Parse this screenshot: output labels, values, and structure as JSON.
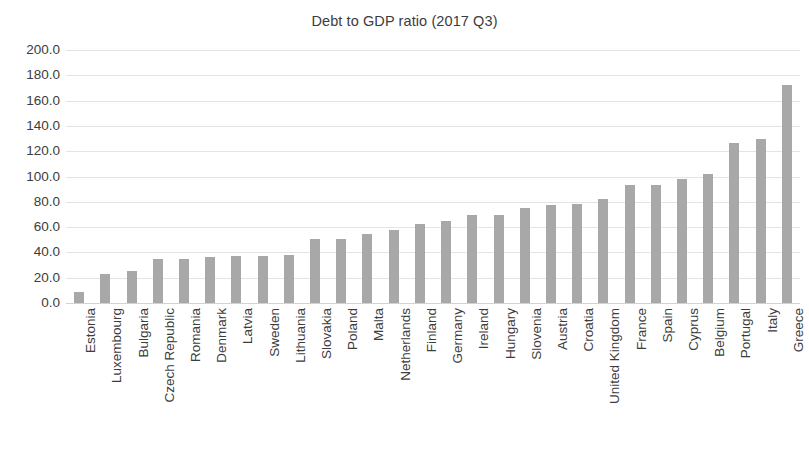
{
  "chart_data": {
    "type": "bar",
    "title": "Debt to GDP ratio (2017 Q3)",
    "xlabel": "",
    "ylabel": "",
    "ylim": [
      0,
      200
    ],
    "ytick_step": 20,
    "ytick_labels": [
      "200.0",
      "180.0",
      "160.0",
      "140.0",
      "120.0",
      "100.0",
      "80.0",
      "60.0",
      "40.0",
      "20.0",
      "0.0"
    ],
    "yticks": [
      200,
      180,
      160,
      140,
      120,
      100,
      80,
      60,
      40,
      20,
      0
    ],
    "grid": true,
    "legend": null,
    "bar_color": "#a8a8a8",
    "categories": [
      "Estonia",
      "Luxembourg",
      "Bulgaria",
      "Czech Republic",
      "Romania",
      "Denmark",
      "Latvia",
      "Sweden",
      "Lithuania",
      "Slovakia",
      "Poland",
      "Malta",
      "Netherlands",
      "Finland",
      "Germany",
      "Ireland",
      "Hungary",
      "Slovenia",
      "Austria",
      "Croatia",
      "United Kingdom",
      "France",
      "Spain",
      "Cyprus",
      "Belgium",
      "Portugal",
      "Italy",
      "Greece"
    ],
    "values": [
      9.0,
      23.0,
      25.5,
      34.5,
      35.0,
      36.0,
      37.0,
      37.5,
      38.0,
      50.5,
      51.0,
      54.5,
      57.5,
      62.5,
      65.0,
      69.5,
      69.5,
      75.0,
      77.5,
      78.0,
      82.5,
      93.5,
      93.5,
      98.0,
      102.0,
      126.5,
      129.5,
      172.0
    ]
  }
}
